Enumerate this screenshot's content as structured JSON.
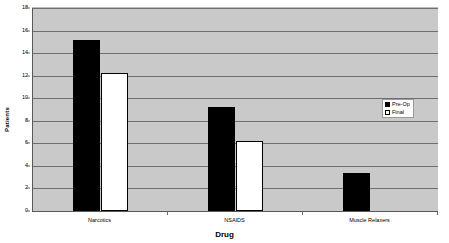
{
  "chart_data": {
    "type": "bar",
    "title": "",
    "xlabel": "Drug",
    "ylabel": "Patients",
    "categories": [
      "Narcotics",
      "NSAIDS",
      "Muscle Relaxers"
    ],
    "series": [
      {
        "name": "Pre-Op",
        "color": "#000000",
        "values": [
          15.2,
          9.2,
          3.4
        ]
      },
      {
        "name": "Final",
        "color": "#ffffff",
        "values": [
          12.2,
          6.2,
          0
        ]
      }
    ],
    "ylim": [
      0,
      18
    ],
    "ytick_labels": [
      "0",
      "2",
      "4",
      "6",
      "8",
      "10",
      "12",
      "14",
      "16",
      "18"
    ],
    "ytick_values": [
      0,
      2,
      4,
      6,
      8,
      10,
      12,
      14,
      16,
      18
    ],
    "grid": true,
    "legend_position": "right",
    "plot_background": "#c9c9c9",
    "gridline_color": "#6f6f6f",
    "axis_color": "#5a5a5a"
  }
}
